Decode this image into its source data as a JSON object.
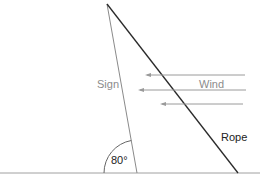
{
  "diagram": {
    "labels": {
      "sign": "Sign",
      "wind": "Wind",
      "rope": "Rope",
      "angle": "80°"
    },
    "colors": {
      "background": "#ffffff",
      "ground": "#9a9a9a",
      "sign_line": "#8a8a8a",
      "rope_line": "#2a2a2a",
      "wind_arrows": "#9a9a9a",
      "arc": "#6a6a6a",
      "gray_text": "#8c8c8c",
      "dark_text": "#222222"
    },
    "wind_arrow_count": 3,
    "angle_degrees": 80
  }
}
